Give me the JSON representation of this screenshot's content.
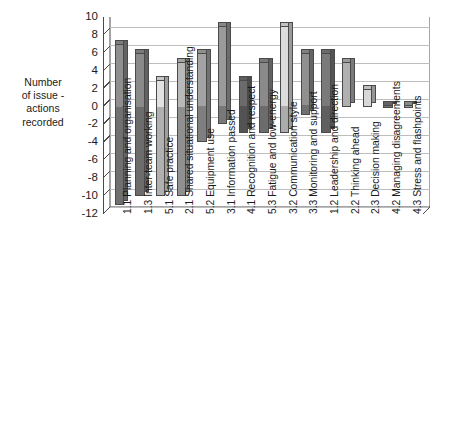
{
  "chart_data": {
    "type": "bar",
    "title": "",
    "subtitle": "",
    "xlabel": "",
    "ylabel": "Number of issue - actions recorded",
    "ylim": [
      -12,
      10
    ],
    "ytick_step": 2,
    "yticks": [
      10,
      8,
      6,
      4,
      2,
      0,
      -2,
      -4,
      -6,
      -8,
      -10,
      -12
    ],
    "grid": true,
    "legend": "none",
    "orientation": "vertical",
    "bar_style": "floating-range-3d",
    "note": "Each bar is a floating range spanning from a negative (issues) to a positive (actions) value.",
    "categories": [
      "1.1 Planning and organisation",
      "1.3 Inter-team working",
      "5.1 Safe practice",
      "2.1 Shared situational understanding",
      "5.2 Equipment use",
      "3.1 Information passed",
      "4.1 Recognition and respect",
      "5.3 Fatigue and low-energy",
      "3.2 Communication style",
      "3.3 Monitoring and support",
      "1.2 Leadership and direction",
      "2.2 Thinking ahead",
      "2.3 Decision making",
      "4.2 Managing disagreements",
      "4.3 Stress and flashpoints"
    ],
    "series": [
      {
        "name": "Positive (actions)",
        "values": [
          7,
          6,
          3,
          5,
          6,
          9,
          3,
          5,
          9,
          6,
          6,
          5,
          2,
          0,
          0
        ]
      },
      {
        "name": "Negative (issues)",
        "values": [
          -11,
          -10,
          -10,
          -10,
          -4,
          -2,
          -3,
          -3,
          -3,
          -1,
          -3,
          0,
          0,
          0,
          0
        ]
      }
    ],
    "bar_colors": [
      "#8f8f8f",
      "#8a8a8a",
      "#e2e2e2",
      "#b9b9b9",
      "#a3a3a3",
      "#9a9a9a",
      "#6b6b6b",
      "#8a8a8a",
      "#dcdcdc",
      "#909090",
      "#7a7a7a",
      "#b0b0b0",
      "#d8d8d8",
      "#707070",
      "#9a9a9a"
    ]
  },
  "axis": {
    "y_title_lines": [
      "Number",
      "of issue -",
      "actions",
      "recorded"
    ]
  },
  "colors": {
    "axis": "#4a4a4a",
    "grid": "#bdbdbd",
    "text": "#1a1a1a",
    "plot_background": "#ffffff"
  }
}
